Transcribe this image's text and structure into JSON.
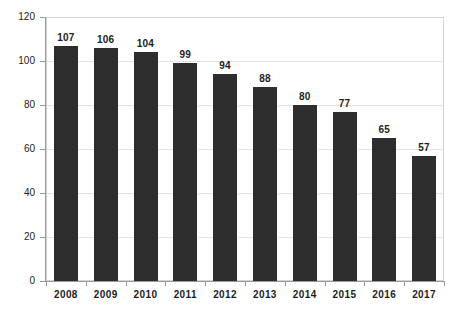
{
  "chart_data": {
    "type": "bar",
    "title": "",
    "subtitle": "",
    "xlabel": "",
    "ylabel": "",
    "categories": [
      "2008",
      "2009",
      "2010",
      "2011",
      "2012",
      "2013",
      "2014",
      "2015",
      "2016",
      "2017"
    ],
    "values": [
      107,
      106,
      104,
      99,
      94,
      88,
      80,
      77,
      65,
      57
    ],
    "data_labels": [
      "107",
      "106",
      "104",
      "99",
      "94",
      "88",
      "80",
      "77",
      "65",
      "57"
    ],
    "ylim": [
      0,
      120
    ],
    "y_ticks": [
      0,
      20,
      40,
      60,
      80,
      100,
      120
    ],
    "y_tick_labels": [
      "0",
      "20",
      "40",
      "60",
      "80",
      "100",
      "120"
    ],
    "grid": "horizontal",
    "legend": "none",
    "series": [
      {
        "name": "",
        "values": [
          107,
          106,
          104,
          99,
          94,
          88,
          80,
          77,
          65,
          57
        ],
        "color": "#2d2d2d"
      }
    ],
    "colors": {
      "bar": "#2d2d2d",
      "background": "#ffffff",
      "gridline": "#e2e2e2",
      "axis": "#9a9a9a",
      "text": "#1d1d1d",
      "plot_border": "#d2d2d2"
    }
  }
}
